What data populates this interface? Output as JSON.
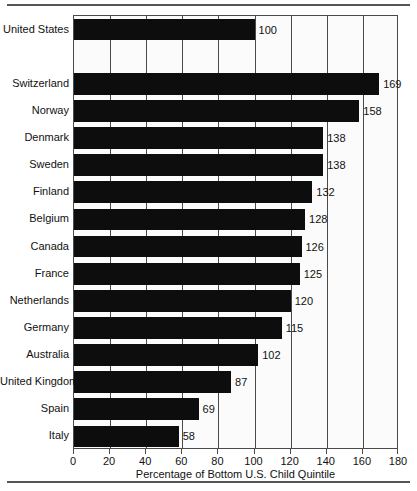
{
  "chart_data": {
    "type": "bar",
    "orientation": "horizontal",
    "title": "",
    "xlabel": "Percentage of Bottom U.S. Child Quintile",
    "ylabel": "",
    "xlim": [
      0,
      180
    ],
    "xticks": [
      0,
      20,
      40,
      60,
      80,
      100,
      120,
      140,
      160,
      180
    ],
    "grid": true,
    "legend": null,
    "categories": [
      "United States",
      "Switzerland",
      "Norway",
      "Denmark",
      "Sweden",
      "Finland",
      "Belgium",
      "Canada",
      "France",
      "Netherlands",
      "Germany",
      "Australia",
      "United Kingdom",
      "Spain",
      "Italy"
    ],
    "values": [
      100,
      169,
      158,
      138,
      138,
      132,
      128,
      126,
      125,
      120,
      115,
      102,
      87,
      69,
      58
    ],
    "value_labels": [
      "100",
      "169",
      "158",
      "138",
      "138",
      "132",
      "128",
      "126",
      "125",
      "120",
      "115",
      "102",
      "87",
      "69",
      "58"
    ],
    "reference_row_index": 0,
    "gap_after_index": 0,
    "bar_color": "#0d0d0d",
    "axis_color": "#4a4a4a",
    "background_color": "#ffffff"
  }
}
